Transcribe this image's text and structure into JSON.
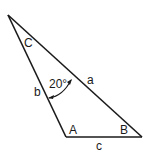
{
  "diagram": {
    "type": "triangle",
    "vertices": {
      "C": {
        "label": "C"
      },
      "A": {
        "label": "A"
      },
      "B": {
        "label": "B"
      }
    },
    "sides": {
      "a": {
        "label": "a"
      },
      "b": {
        "label": "b"
      },
      "c": {
        "label": "c"
      }
    },
    "angle_annotation": {
      "value": "20°",
      "description": "angle between side a and side b marked with arc"
    },
    "line_color": "#1a1a1a"
  }
}
